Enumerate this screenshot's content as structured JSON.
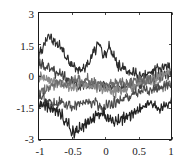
{
  "chart_data": {
    "type": "line",
    "title": "",
    "subtitle": "",
    "xlabel": "",
    "ylabel": "",
    "xlim": [
      -1,
      1
    ],
    "ylim": [
      -3,
      3
    ],
    "xticks": [
      -1,
      -0.5,
      0,
      0.5,
      1
    ],
    "xtick_labels": [
      "-1",
      "-0.5",
      "0",
      "0.5",
      "1"
    ],
    "yticks": [
      -3,
      -1.5,
      0,
      1.5,
      3
    ],
    "ytick_labels": [
      "-3",
      "-1.5",
      "0",
      "1.5",
      "3"
    ],
    "grid": false,
    "legend": "none",
    "annotations": [],
    "background_color": "#ffffff",
    "frame_color": "#1a1a1a",
    "x": [
      -1,
      -0.98,
      -0.96,
      -0.94,
      -0.92,
      -0.9,
      -0.88,
      -0.86,
      -0.84,
      -0.82,
      -0.8,
      -0.78,
      -0.76,
      -0.74,
      -0.72,
      -0.7,
      -0.68,
      -0.66,
      -0.64,
      -0.62,
      -0.6,
      -0.58,
      -0.56,
      -0.54,
      -0.52,
      -0.5,
      -0.48,
      -0.46,
      -0.44,
      -0.42,
      -0.4,
      -0.38,
      -0.36,
      -0.34,
      -0.32,
      -0.3,
      -0.28,
      -0.26,
      -0.24,
      -0.22,
      -0.2,
      -0.18,
      -0.16,
      -0.14,
      -0.12,
      -0.1,
      -0.08,
      -0.06,
      -0.04,
      -0.02,
      0,
      0.02,
      0.04,
      0.06,
      0.08,
      0.1,
      0.12,
      0.14,
      0.16,
      0.18,
      0.2,
      0.22,
      0.24,
      0.26,
      0.28,
      0.3,
      0.32,
      0.34,
      0.36,
      0.38,
      0.4,
      0.42,
      0.44,
      0.46,
      0.48,
      0.5,
      0.52,
      0.54,
      0.56,
      0.58,
      0.6,
      0.62,
      0.64,
      0.66,
      0.68,
      0.7,
      0.72,
      0.74,
      0.76,
      0.78,
      0.8,
      0.82,
      0.84,
      0.86,
      0.88,
      0.9,
      0.92,
      0.94,
      0.96,
      0.98,
      1
    ],
    "series": [
      {
        "name": "trace-1",
        "color": "#2b2b2b",
        "width": 1.1,
        "values": [
          0.75,
          1.05,
          1.3,
          1.12,
          1.45,
          1.68,
          1.52,
          1.78,
          1.95,
          1.72,
          1.88,
          1.6,
          1.75,
          1.5,
          1.62,
          1.38,
          1.55,
          1.3,
          1.12,
          1.28,
          1.0,
          0.82,
          0.95,
          0.7,
          0.52,
          0.68,
          0.45,
          0.6,
          0.38,
          0.5,
          0.28,
          0.42,
          0.2,
          0.35,
          0.48,
          0.3,
          0.45,
          0.62,
          0.48,
          0.7,
          0.9,
          1.12,
          1.35,
          1.18,
          1.42,
          1.6,
          1.45,
          1.25,
          1.05,
          0.88,
          1.1,
          0.92,
          1.2,
          1.45,
          1.28,
          1.05,
          0.85,
          1.0,
          0.78,
          0.6,
          0.42,
          0.58,
          0.35,
          0.5,
          0.28,
          0.4,
          0.2,
          0.35,
          0.15,
          0.3,
          0.1,
          0.25,
          0.05,
          0.2,
          0.0,
          -0.12,
          0.05,
          -0.1,
          0.08,
          -0.05,
          0.12,
          -0.02,
          0.15,
          0.02,
          0.18,
          0.05,
          0.2,
          0.38,
          0.22,
          0.4,
          0.25,
          0.45,
          0.3,
          0.5,
          0.35,
          0.55,
          0.38,
          0.58,
          0.42,
          0.2,
          0.05
        ]
      },
      {
        "name": "trace-2",
        "color": "#3f3f3f",
        "width": 1.1,
        "values": [
          0.4,
          0.62,
          0.45,
          0.7,
          0.52,
          0.35,
          0.55,
          0.3,
          0.45,
          0.25,
          0.4,
          0.18,
          0.32,
          0.1,
          0.25,
          0.05,
          0.2,
          -0.05,
          0.1,
          -0.1,
          0.05,
          -0.15,
          -0.3,
          -0.12,
          -0.28,
          -0.1,
          -0.25,
          -0.4,
          -0.22,
          -0.38,
          -0.55,
          -0.35,
          -0.5,
          -0.3,
          -0.45,
          -0.25,
          -0.4,
          -0.58,
          -0.38,
          -0.55,
          -0.35,
          -0.5,
          -0.3,
          -0.45,
          -0.62,
          -0.42,
          -0.58,
          -0.38,
          -0.55,
          -0.35,
          -0.5,
          -0.68,
          -0.48,
          -0.65,
          -0.45,
          -0.6,
          -0.4,
          -0.55,
          -0.72,
          -0.52,
          -0.68,
          -0.48,
          -0.62,
          -0.42,
          -0.58,
          -0.38,
          -0.52,
          -0.32,
          -0.48,
          -0.28,
          -0.42,
          -0.22,
          -0.38,
          -0.55,
          -0.35,
          -0.5,
          -0.3,
          -0.45,
          -0.25,
          -0.4,
          -0.2,
          -0.35,
          -0.15,
          -0.3,
          -0.1,
          -0.25,
          -0.05,
          -0.2,
          0.0,
          -0.15,
          0.05,
          -0.1,
          0.1,
          -0.05,
          0.15,
          0.0,
          0.18,
          0.02,
          0.2,
          0.05,
          -0.05
        ]
      },
      {
        "name": "trace-3",
        "color": "#8a8a8a",
        "width": 1.2,
        "values": [
          0.1,
          -0.1,
          0.05,
          -0.18,
          -0.02,
          -0.22,
          -0.05,
          -0.25,
          -0.08,
          -0.3,
          -0.12,
          -0.35,
          -0.15,
          -0.4,
          -0.2,
          -0.45,
          -0.25,
          -0.48,
          -0.28,
          -0.5,
          -0.3,
          -0.52,
          -0.35,
          -0.55,
          -0.38,
          -0.58,
          -0.4,
          -0.6,
          -0.42,
          -0.62,
          -0.45,
          -0.28,
          -0.48,
          -0.3,
          -0.5,
          -0.32,
          -0.52,
          -0.35,
          -0.55,
          -0.38,
          -0.58,
          -0.4,
          -0.6,
          -0.42,
          -0.62,
          -0.45,
          -0.65,
          -0.48,
          -0.68,
          -0.5,
          -0.7,
          -0.52,
          -0.72,
          -0.55,
          -0.75,
          -0.58,
          -0.78,
          -0.6,
          -0.8,
          -0.62,
          -0.82,
          -0.6,
          -0.78,
          -0.58,
          -0.75,
          -0.55,
          -0.72,
          -0.5,
          -0.68,
          -0.45,
          -0.62,
          -0.4,
          -0.58,
          -0.35,
          -0.52,
          -0.3,
          -0.48,
          -0.25,
          -0.42,
          -0.2,
          -0.38,
          -0.15,
          -0.32,
          -0.1,
          -0.28,
          -0.05,
          -0.22,
          0.0,
          -0.18,
          0.05,
          -0.12,
          0.1,
          -0.08,
          0.15,
          -0.02,
          0.2,
          0.05,
          0.25,
          0.1,
          0.3,
          0.15
        ]
      },
      {
        "name": "trace-4",
        "color": "#6b6b6b",
        "width": 1.1,
        "values": [
          -0.9,
          -0.7,
          -0.85,
          -0.6,
          -0.78,
          -0.55,
          -0.72,
          -0.48,
          -0.65,
          -0.42,
          -0.58,
          -0.35,
          -0.5,
          -0.3,
          -0.45,
          -0.25,
          -0.4,
          -0.2,
          -0.35,
          -0.52,
          -0.3,
          -0.45,
          -0.25,
          -0.4,
          -0.2,
          -0.35,
          -0.15,
          -0.3,
          -0.1,
          -0.25,
          -0.05,
          -0.2,
          -0.38,
          -0.18,
          -0.32,
          -0.12,
          -0.28,
          -0.08,
          -0.22,
          -0.4,
          -0.2,
          -0.35,
          -0.15,
          -0.3,
          -0.45,
          -0.25,
          -0.4,
          -0.2,
          -0.35,
          -0.55,
          -0.32,
          -0.5,
          -0.28,
          -0.45,
          -0.25,
          -0.4,
          -0.2,
          -0.35,
          -0.15,
          -0.3,
          -0.45,
          -0.25,
          -0.4,
          -0.2,
          -0.35,
          -0.5,
          -0.3,
          -0.45,
          -0.25,
          -0.4,
          -0.2,
          -0.35,
          -0.15,
          -0.3,
          -0.1,
          -0.25,
          -0.05,
          -0.2,
          -0.35,
          -0.15,
          -0.3,
          -0.1,
          -0.25,
          -0.05,
          -0.2,
          -0.38,
          -0.18,
          -0.32,
          -0.5,
          -0.3,
          -0.45,
          -0.62,
          -0.42,
          -0.58,
          -0.38,
          -0.52,
          -0.32,
          -0.48,
          -0.28,
          -0.42,
          -0.25
        ]
      },
      {
        "name": "trace-5",
        "color": "#4a4a4a",
        "width": 1.1,
        "values": [
          -0.85,
          -1.05,
          -0.88,
          -1.1,
          -0.92,
          -1.15,
          -1.35,
          -1.12,
          -1.3,
          -1.08,
          -1.25,
          -1.45,
          -1.22,
          -1.4,
          -1.18,
          -1.35,
          -1.15,
          -1.3,
          -1.12,
          -1.28,
          -1.45,
          -1.25,
          -1.42,
          -1.2,
          -1.38,
          -1.55,
          -1.32,
          -1.5,
          -1.28,
          -1.45,
          -1.25,
          -1.4,
          -1.2,
          -1.35,
          -1.15,
          -1.3,
          -1.1,
          -1.25,
          -1.05,
          -1.2,
          -1.38,
          -1.15,
          -1.32,
          -1.1,
          -1.28,
          -1.45,
          -1.22,
          -1.4,
          -1.6,
          -1.35,
          -1.55,
          -1.3,
          -1.5,
          -1.25,
          -1.45,
          -1.2,
          -1.4,
          -1.15,
          -1.35,
          -1.1,
          -1.28,
          -1.05,
          -1.22,
          -1.0,
          -1.18,
          -0.95,
          -1.12,
          -0.9,
          -1.08,
          -0.85,
          -1.02,
          -0.8,
          -0.95,
          -0.75,
          -0.9,
          -0.7,
          -0.85,
          -0.65,
          -0.8,
          -0.6,
          -0.75,
          -0.55,
          -0.7,
          -0.85,
          -0.62,
          -0.78,
          -0.58,
          -0.72,
          -0.52,
          -0.68,
          -0.48,
          -0.62,
          -0.45,
          -0.58,
          -0.42,
          -0.55,
          -0.38,
          -0.5,
          -0.35,
          -0.48,
          -0.3
        ]
      },
      {
        "name": "trace-6",
        "color": "#222222",
        "width": 1.2,
        "values": [
          -1.15,
          -1.35,
          -1.18,
          -1.42,
          -1.22,
          -1.48,
          -1.28,
          -1.55,
          -1.32,
          -1.6,
          -1.38,
          -1.68,
          -1.45,
          -1.75,
          -1.52,
          -1.82,
          -1.6,
          -1.9,
          -1.68,
          -2.0,
          -2.25,
          -2.05,
          -2.35,
          -2.15,
          -2.45,
          -2.7,
          -2.48,
          -2.9,
          -2.6,
          -2.35,
          -2.6,
          -2.3,
          -2.5,
          -2.2,
          -2.4,
          -2.12,
          -2.3,
          -2.05,
          -2.22,
          -1.98,
          -2.15,
          -1.9,
          -2.08,
          -1.82,
          -2.0,
          -1.75,
          -1.95,
          -1.7,
          -1.88,
          -1.62,
          -1.82,
          -2.1,
          -1.85,
          -2.15,
          -1.9,
          -2.2,
          -1.95,
          -2.3,
          -2.0,
          -2.25,
          -1.98,
          -2.2,
          -1.92,
          -2.12,
          -1.85,
          -2.05,
          -1.78,
          -1.98,
          -1.72,
          -1.9,
          -1.65,
          -1.82,
          -1.58,
          -1.75,
          -1.5,
          -1.68,
          -1.42,
          -1.6,
          -1.35,
          -1.52,
          -1.28,
          -1.45,
          -1.22,
          -1.4,
          -1.15,
          -1.32,
          -1.48,
          -1.25,
          -1.42,
          -1.62,
          -1.38,
          -1.58,
          -1.32,
          -1.52,
          -1.28,
          -1.48,
          -1.22,
          -1.4,
          -1.15,
          -1.32,
          -1.05
        ]
      }
    ]
  },
  "plot_box": {
    "left": 38,
    "top": 12,
    "right": 172,
    "bottom": 140
  }
}
